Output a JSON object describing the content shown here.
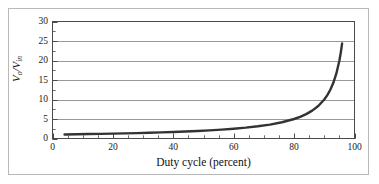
{
  "figure": {
    "background_color": "#ffffff",
    "frame_color": "#b9b9b9",
    "axis_color": "#4a4a4a",
    "grid_color": "#8c8c8c",
    "curve_color": "#333333",
    "text_color": "#1a1a1a"
  },
  "chart_data": {
    "type": "line",
    "title": "",
    "xlabel": "Duty cycle (percent)",
    "ylabel_html": "V<sub>o</sub>/V<sub>in</sub>",
    "ylabel_text": "Vo/Vin",
    "xlim": [
      0,
      100
    ],
    "ylim": [
      0,
      30
    ],
    "xticks": [
      0,
      20,
      40,
      60,
      80,
      100
    ],
    "xtick_labels": [
      "0",
      "20",
      "40",
      "60",
      "80",
      "100"
    ],
    "xminor_step": 5,
    "yticks": [
      0,
      5,
      10,
      15,
      20,
      25,
      30
    ],
    "ytick_labels": [
      "0",
      "5",
      "10",
      "15",
      "20",
      "25",
      "30"
    ],
    "yminor_step": 2.5,
    "grid": "horizontal",
    "legend": "none",
    "relation": "Vo/Vin = 1/(1 - D)",
    "x": [
      4,
      8,
      12,
      16,
      20,
      24,
      28,
      32,
      36,
      40,
      44,
      48,
      52,
      56,
      60,
      64,
      68,
      72,
      76,
      80,
      82,
      84,
      86,
      88,
      90,
      91,
      92,
      93,
      94,
      95,
      95.5,
      95.9
    ],
    "values": [
      1.04,
      1.09,
      1.14,
      1.19,
      1.25,
      1.32,
      1.39,
      1.47,
      1.56,
      1.67,
      1.79,
      1.92,
      2.08,
      2.27,
      2.5,
      2.78,
      3.13,
      3.57,
      4.17,
      5.0,
      5.56,
      6.25,
      7.14,
      8.33,
      10.0,
      11.11,
      12.5,
      14.29,
      16.67,
      20.0,
      22.22,
      24.39
    ]
  }
}
